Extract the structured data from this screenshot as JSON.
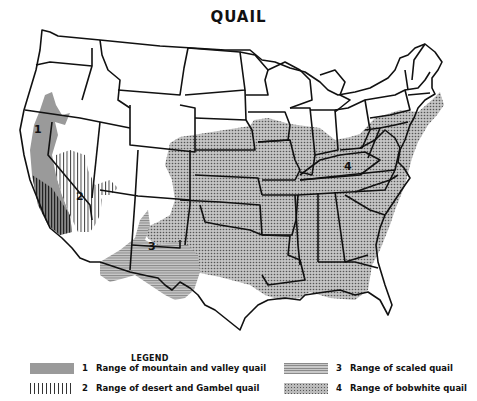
{
  "title": "QUAIL",
  "legend": {
    "title": "LEGEND",
    "items": [
      {
        "number": "1",
        "label": "Range of mountain and valley quail",
        "pattern": "solid-gray"
      },
      {
        "number": "2",
        "label": "Range of desert and Gambel quail",
        "pattern": "vertical-hatch"
      },
      {
        "number": "3",
        "label": "Range of scaled quail",
        "pattern": "horizontal-hatch"
      },
      {
        "number": "4",
        "label": "Range of bobwhite quail",
        "pattern": "dotted"
      }
    ]
  },
  "map_labels": [
    {
      "number": "1",
      "region": "California/Oregon"
    },
    {
      "number": "2",
      "region": "Arizona/Nevada"
    },
    {
      "number": "3",
      "region": "New Mexico"
    },
    {
      "number": "4",
      "region": "Ohio"
    }
  ]
}
